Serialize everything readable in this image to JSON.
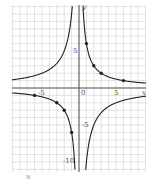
{
  "chart_data": {
    "type": "line",
    "title": "",
    "xlabel": "x",
    "ylabel": "y",
    "xlim": [
      -9,
      9
    ],
    "ylim": [
      -11,
      11
    ],
    "grid": true,
    "x_tick_labels": [
      "-5",
      "0",
      "5"
    ],
    "y_tick_labels": [
      "5",
      "-5",
      "-10"
    ],
    "series": [
      {
        "name": "y = 6/x",
        "points_marked": [
          [
            1,
            6
          ],
          [
            2,
            3
          ],
          [
            3,
            2
          ],
          [
            6,
            1
          ],
          [
            -1,
            -6
          ],
          [
            -2,
            -3
          ],
          [
            -3,
            -2
          ],
          [
            -6,
            -1
          ]
        ]
      },
      {
        "name": "y = -10/x",
        "points_marked": []
      }
    ]
  },
  "labels": {
    "y_axis": "y",
    "x_axis": "x",
    "x_neg5": "-5",
    "x_zero": "0",
    "x_pos5": "5",
    "y_pos5": "5",
    "y_neg5": "-5",
    "y_neg10": "-10",
    "caption": "N"
  },
  "colors": {
    "grid": "#cfcfcf",
    "axis": "#444444",
    "curve": "#222222",
    "point": "#222222"
  }
}
